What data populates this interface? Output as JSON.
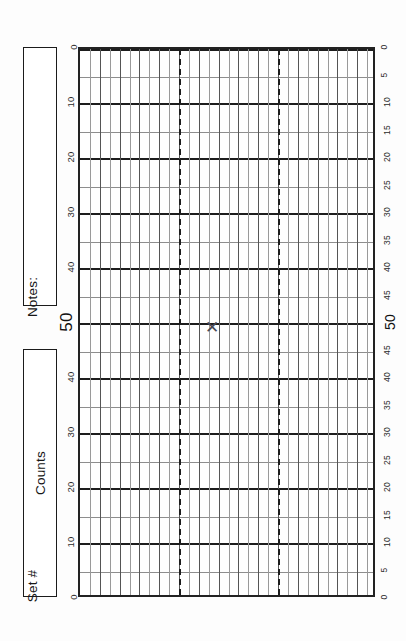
{
  "form": {
    "title": "Counts Tally Grid Sheet",
    "notes_label": "Notes:",
    "counts_label": "Counts",
    "set_label": "Set #"
  },
  "chart_data": {
    "type": "scatter",
    "xlabel": "Set #",
    "ylabel": "Counts",
    "grid": true,
    "legend": false,
    "orientation": "rotated-90",
    "ylim": [
      0,
      50
    ],
    "axis_left_ticks": [
      "0",
      "10",
      "20",
      "30",
      "40",
      "50",
      "40",
      "30",
      "20",
      "10",
      "0"
    ],
    "axis_right_ticks": [
      "0",
      "5",
      "10",
      "15",
      "20",
      "25",
      "30",
      "35",
      "40",
      "45",
      "50",
      "45",
      "40",
      "35",
      "30",
      "25",
      "20",
      "15",
      "10",
      "5",
      "0"
    ],
    "emphasized_tick": "50",
    "major_interval": 10,
    "minor_interval": 5,
    "column_count": 30,
    "section_dividers": 2,
    "points": [
      {
        "label": "X",
        "set": 16,
        "count": 50
      }
    ],
    "values": [
      50
    ],
    "categories": [
      "16"
    ]
  },
  "marks": [
    {
      "glyph": "✕",
      "name": "data-point-x",
      "left_pct": 45.0,
      "top_pct": 50.9
    }
  ],
  "colors": {
    "ink": "#1d1d1d",
    "grid_minor": "#8e8e8e",
    "grid_major": "#1d1d1d",
    "paper": "#fdfdfd",
    "mark": "#4a4a55"
  }
}
